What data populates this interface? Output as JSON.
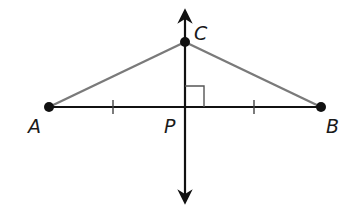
{
  "diagram": {
    "points": {
      "A": {
        "label": "A",
        "x": 49,
        "y": 107
      },
      "B": {
        "label": "B",
        "x": 321,
        "y": 107
      },
      "C": {
        "label": "C",
        "x": 185,
        "y": 42
      },
      "P": {
        "label": "P",
        "x": 185,
        "y": 107
      }
    },
    "colors": {
      "line": "#111111",
      "segment": "#7a7a7a",
      "right_angle": "#555555"
    },
    "tick_marks": [
      {
        "segment": "AP",
        "x": 113
      },
      {
        "segment": "PB",
        "x": 254
      }
    ],
    "right_angle_marker": {
      "at": "P"
    }
  }
}
